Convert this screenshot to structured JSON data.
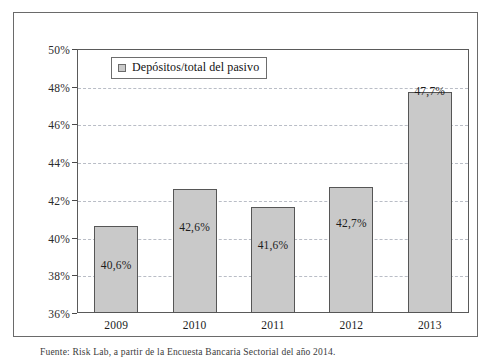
{
  "chart_data": {
    "type": "bar",
    "title": "",
    "subtitle": "",
    "xlabel": "",
    "ylabel": "",
    "categories": [
      "2009",
      "2010",
      "2011",
      "2012",
      "2013"
    ],
    "values": [
      40.6,
      42.6,
      41.6,
      42.7,
      47.7
    ],
    "data_labels": [
      "40,6%",
      "42,6%",
      "41,6%",
      "42,7%",
      "47,7%"
    ],
    "series": [
      {
        "name": "Depósitos/total del pasivo",
        "values": [
          40.6,
          42.6,
          41.6,
          42.7,
          47.7
        ]
      }
    ],
    "ylim": [
      36,
      50
    ],
    "ytick_step": 2,
    "ytick_labels": [
      "50%",
      "48%",
      "46%",
      "44%",
      "42%",
      "40%",
      "38%",
      "36%"
    ],
    "ytick_values": [
      50,
      48,
      46,
      44,
      42,
      40,
      38,
      36
    ],
    "xtick_labels": [
      "2009",
      "2010",
      "2011",
      "2012",
      "2013"
    ],
    "grid": "horizontal-dashed",
    "legend_position": "top-left-inside",
    "bar_color": "#c9c9c9",
    "bar_border_color": "#565656",
    "gridline_color": "#b9bdc6"
  },
  "legend": {
    "label": "Depósitos/total del pasivo"
  },
  "caption": {
    "text": "Fuente: Risk Lab, a partir de la Encuesta Bancaria Sectorial del año 2014."
  }
}
